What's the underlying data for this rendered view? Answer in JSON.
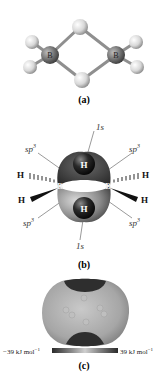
{
  "figure": {
    "panel_a": {
      "caption": "(a)",
      "atoms": {
        "boron_left": "B",
        "boron_right": "B"
      }
    },
    "panel_b": {
      "caption": "(b)",
      "orbital_top": "1s",
      "orbital_bottom": "1s",
      "hybrid_top_left": "sp",
      "hybrid_top_right": "sp",
      "hybrid_bottom_left": "sp",
      "hybrid_bottom_right": "sp",
      "hybrid_superscript": "3",
      "bridge_h_top": "H",
      "bridge_h_bottom": "H",
      "terminal_h_left_top": "H",
      "terminal_h_left_bottom": "H",
      "terminal_h_right_top": "H",
      "terminal_h_right_bottom": "H",
      "boron_left": "B",
      "boron_right": "B"
    },
    "panel_c": {
      "caption": "(c)",
      "scale_min_label": "−39 kJ mol",
      "scale_max_label": "39 kJ mol",
      "unit_superscript": "−1"
    }
  }
}
